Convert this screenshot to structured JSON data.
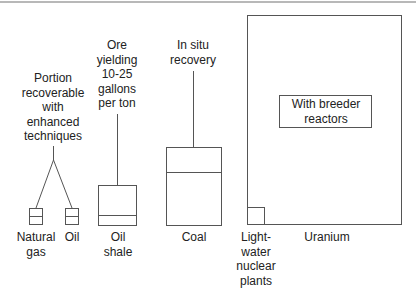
{
  "diagram": {
    "resources": {
      "natural_gas": {
        "label_line1": "Natural",
        "label_line2": "gas"
      },
      "oil": {
        "label": "Oil"
      },
      "oil_shale": {
        "label_line1": "Oil",
        "label_line2": "shale"
      },
      "coal": {
        "label": "Coal"
      },
      "uranium": {
        "label": "Uranium"
      },
      "light_water": {
        "line1": "Light-",
        "line2": "water",
        "line3": "nuclear",
        "line4": "plants"
      }
    },
    "annotations": {
      "enhanced": {
        "line1": "Portion",
        "line2": "recoverable",
        "line3": "with",
        "line4": "enhanced",
        "line5": "techniques"
      },
      "ore": {
        "line1": "Ore",
        "line2": "yielding",
        "line3": "10-25",
        "line4": "gallons",
        "line5": "per ton"
      },
      "in_situ": {
        "line1": "In situ",
        "line2": "recovery"
      },
      "breeder": {
        "line1": "With breeder",
        "line2": "reactors"
      }
    },
    "colors": {
      "line": "#555555",
      "text": "#222222",
      "top_rule": "#b8b8b8"
    }
  }
}
